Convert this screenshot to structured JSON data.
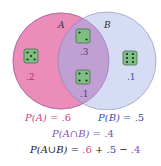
{
  "diagram": {
    "type": "venn",
    "sets": [
      {
        "label": "A",
        "color": "#ec8cb8"
      },
      {
        "label": "B",
        "color": "#d6dcf4"
      }
    ],
    "intersection_color": "#c09fd2",
    "regions": [
      {
        "region": "A only",
        "die": 5,
        "probability": ".2"
      },
      {
        "region": "A and B",
        "die": 2,
        "probability": ".3"
      },
      {
        "region": "A and B",
        "die": 4,
        "probability": ".1"
      },
      {
        "region": "B only",
        "die": 6,
        "probability": ".1"
      }
    ]
  },
  "equations": {
    "pa_lhs": "P(A) = ",
    "pa_val": ".6",
    "pb_lhs": "P(B) = ",
    "pb_val": ".5",
    "pab_lhs": "P(A∩B) = ",
    "pab_val": ".4",
    "union_lhs": "P(A∪B) = ",
    "union_a": ".6",
    "plus": " + ",
    "union_b": ".5",
    "minus": " − ",
    "union_ab": ".4"
  }
}
